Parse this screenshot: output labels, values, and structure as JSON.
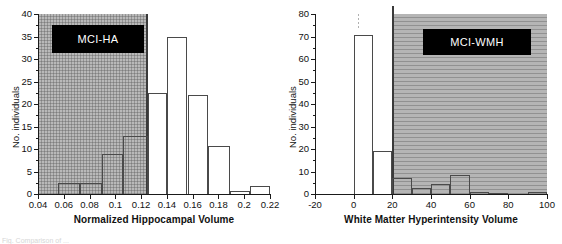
{
  "figure": {
    "caption_partial": "Fig. Comparison of ...",
    "panels": [
      "MCI-HA",
      "MCI-WMH"
    ]
  },
  "chart_data": [
    {
      "type": "bar",
      "id": "mci-ha",
      "title": "",
      "legend_label": "MCI-HA",
      "xlabel": "Normalized Hippocampal Volume",
      "ylabel": "No. individuals",
      "xlim": [
        0.04,
        0.22
      ],
      "ylim": [
        0,
        40
      ],
      "xticks": [
        0.04,
        0.06,
        0.08,
        0.1,
        0.12,
        0.14,
        0.16,
        0.18,
        0.2,
        0.22
      ],
      "xticklabels": [
        "0.04",
        "0.06",
        "0.08",
        "0.1",
        "0.12",
        "0.14",
        "0.16",
        "0.18",
        "0.2",
        "0.22"
      ],
      "yticks": [
        0,
        5,
        10,
        15,
        20,
        25,
        30,
        35,
        40
      ],
      "yticklabels": [
        "0",
        "5",
        "10",
        "15",
        "20",
        "25",
        "30",
        "35",
        "40"
      ],
      "grid": false,
      "legend_position": "upper-left",
      "shaded_region": {
        "x_from": 0.04,
        "x_to": 0.125,
        "label": "MCI-HA"
      },
      "bin_edges": [
        0.0557,
        0.0725,
        0.0893,
        0.1061,
        0.125,
        0.14,
        0.156,
        0.172,
        0.189,
        0.2045,
        0.22
      ],
      "bars": [
        {
          "x_start": 0.0557,
          "x_end": 0.0725,
          "value": 2.5
        },
        {
          "x_start": 0.0725,
          "x_end": 0.0893,
          "value": 2.5
        },
        {
          "x_start": 0.0893,
          "x_end": 0.1061,
          "value": 9.0
        },
        {
          "x_start": 0.1061,
          "x_end": 0.125,
          "value": 12.8
        },
        {
          "x_start": 0.125,
          "x_end": 0.14,
          "value": 22.5
        },
        {
          "x_start": 0.14,
          "x_end": 0.156,
          "value": 35.0
        },
        {
          "x_start": 0.156,
          "x_end": 0.172,
          "value": 22.0
        },
        {
          "x_start": 0.172,
          "x_end": 0.189,
          "value": 10.7
        },
        {
          "x_start": 0.189,
          "x_end": 0.2045,
          "value": 0.7
        },
        {
          "x_start": 0.2045,
          "x_end": 0.22,
          "value": 1.7
        }
      ]
    },
    {
      "type": "bar",
      "id": "mci-wmh",
      "title": "",
      "legend_label": "MCI-WMH",
      "xlabel": "White Matter Hyperintensity Volume",
      "ylabel": "No. individuals",
      "xlim": [
        -20,
        100
      ],
      "ylim": [
        0,
        80
      ],
      "xticks": [
        -20,
        0,
        20,
        40,
        60,
        80,
        100
      ],
      "xticklabels": [
        "-20",
        "0",
        "20",
        "40",
        "60",
        "80",
        "100"
      ],
      "yticks": [
        0,
        10,
        20,
        30,
        40,
        50,
        60,
        70,
        80
      ],
      "yticklabels": [
        "0",
        "10",
        "20",
        "30",
        "40",
        "50",
        "60",
        "70",
        "80"
      ],
      "grid": false,
      "legend_position": "upper-right",
      "shaded_region": {
        "x_from": 20,
        "x_to": 100,
        "label": "MCI-WMH"
      },
      "bin_edges": [
        0,
        10,
        20,
        30,
        40,
        50,
        60,
        70,
        80,
        90,
        100
      ],
      "bars": [
        {
          "x_start": 0,
          "x_end": 10,
          "value": 70.5
        },
        {
          "x_start": 10,
          "x_end": 20,
          "value": 19.0
        },
        {
          "x_start": 20,
          "x_end": 30,
          "value": 7.0
        },
        {
          "x_start": 30,
          "x_end": 40,
          "value": 2.5
        },
        {
          "x_start": 40,
          "x_end": 50,
          "value": 4.3
        },
        {
          "x_start": 50,
          "x_end": 60,
          "value": 8.5
        },
        {
          "x_start": 60,
          "x_end": 70,
          "value": 1.0
        },
        {
          "x_start": 70,
          "x_end": 80,
          "value": 0.3
        },
        {
          "x_start": 80,
          "x_end": 90,
          "value": 0.0
        },
        {
          "x_start": 90,
          "x_end": 100,
          "value": 0.8
        }
      ]
    }
  ],
  "colors": {
    "shade": "#b9b9b9",
    "bar_outline": "#4a4a4a",
    "axis": "#1a1a1a",
    "legend_bg": "#000000",
    "legend_text": "#ffffff"
  }
}
